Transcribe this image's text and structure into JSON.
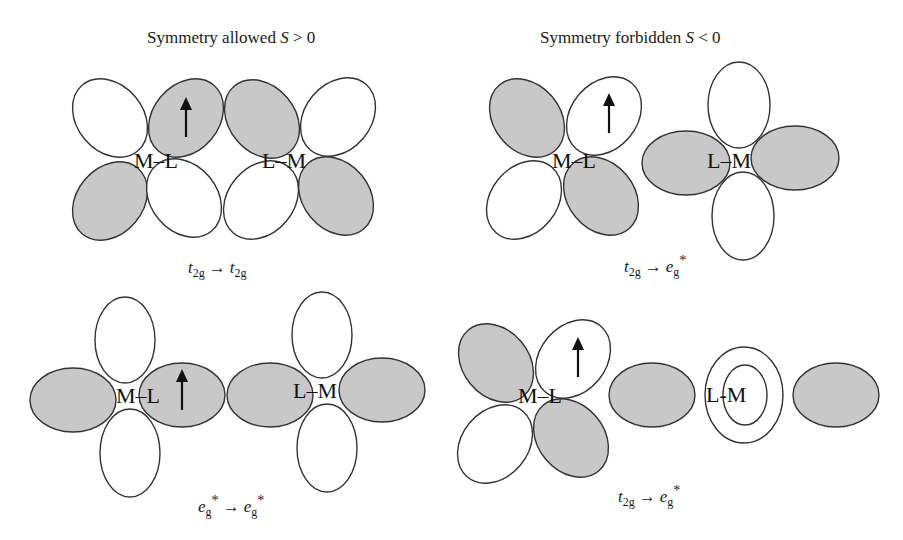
{
  "titles": {
    "allowed": "Symmetry allowed ",
    "allowed_s": "S",
    "allowed_rel": " > 0",
    "forbidden": "Symmetry forbidden ",
    "forbidden_s": "S",
    "forbidden_rel": " < 0"
  },
  "colors": {
    "shaded_lobe": "#c8c8c8",
    "open_lobe": "#ffffff",
    "outline": "#333333"
  },
  "panels": [
    {
      "id": "top-left",
      "group": "allowed",
      "left_label": "M–L",
      "right_label": "L–M",
      "caption": {
        "from_base": "t",
        "from_sub": "2g",
        "arrow": "→",
        "to_base": "t",
        "to_sub": "2g",
        "to_sup": ""
      }
    },
    {
      "id": "top-right",
      "group": "forbidden",
      "left_label": "M–L",
      "right_label": "L–M",
      "caption": {
        "from_base": "t",
        "from_sub": "2g",
        "arrow": "→",
        "to_base": "e",
        "to_sub": "g",
        "to_sup": "*"
      }
    },
    {
      "id": "bottom-left",
      "group": "allowed",
      "left_label": "M–L",
      "right_label": "L–M",
      "caption": {
        "from_base": "e",
        "from_sub": "g",
        "from_sup": "*",
        "arrow": "→",
        "to_base": "e",
        "to_sub": "g",
        "to_sup": "*"
      }
    },
    {
      "id": "bottom-right",
      "group": "forbidden",
      "left_label": "M–L",
      "right_label": "L-M",
      "caption": {
        "from_base": "t",
        "from_sub": "2g",
        "arrow": "→",
        "to_base": "e",
        "to_sub": "g",
        "to_sup": "*"
      }
    }
  ],
  "electron_spin": "↑"
}
